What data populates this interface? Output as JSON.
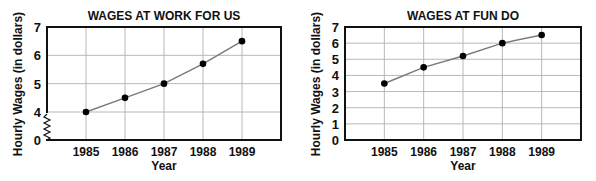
{
  "chart_data": [
    {
      "type": "line",
      "title": "WAGES AT WORK FOR US",
      "xlabel": "Year",
      "ylabel": "Hourly Wages (in dollars)",
      "categories": [
        "1985",
        "1986",
        "1987",
        "1988",
        "1989"
      ],
      "values": [
        4.0,
        4.5,
        5.0,
        5.7,
        6.5
      ],
      "y_ticks": [
        "0",
        "4",
        "5",
        "6",
        "7"
      ],
      "ylim": [
        0,
        7
      ],
      "axis_break": "between 0 and 4",
      "grid": true,
      "legend": null
    },
    {
      "type": "line",
      "title": "WAGES AT FUN DO",
      "xlabel": "Year",
      "ylabel": "Hourly Wages (in dollars)",
      "categories": [
        "1985",
        "1986",
        "1987",
        "1988",
        "1989"
      ],
      "values": [
        3.5,
        4.5,
        5.2,
        6.0,
        6.5
      ],
      "y_ticks": [
        "0",
        "1",
        "2",
        "3",
        "4",
        "5",
        "6",
        "7"
      ],
      "ylim": [
        0,
        7
      ],
      "grid": true,
      "legend": null
    }
  ],
  "colors": {
    "line": "#7a7a7a",
    "marker": "#000000",
    "grid": "#b8b8b8",
    "frame": "#111111"
  }
}
